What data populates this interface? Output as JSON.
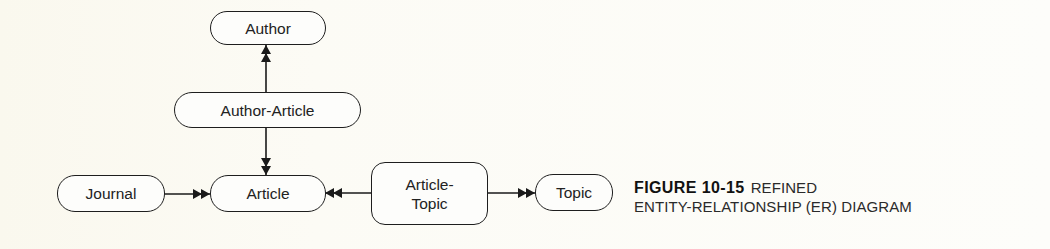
{
  "diagram": {
    "type": "entity-relationship",
    "entities": [
      {
        "id": "author",
        "label": "Author"
      },
      {
        "id": "author_article",
        "label": "Author-Article"
      },
      {
        "id": "journal",
        "label": "Journal"
      },
      {
        "id": "article",
        "label": "Article"
      },
      {
        "id": "article_topic",
        "label_line1": "Article-",
        "label_line2": "Topic"
      },
      {
        "id": "topic",
        "label": "Topic"
      }
    ],
    "relationships": [
      {
        "from": "author_article",
        "to": "author",
        "arrow": "double-head"
      },
      {
        "from": "author_article",
        "to": "article",
        "arrow": "double-head"
      },
      {
        "from": "journal",
        "to": "article",
        "arrow": "double-head"
      },
      {
        "from": "article_topic",
        "to": "article",
        "arrow": "double-head"
      },
      {
        "from": "article_topic",
        "to": "topic",
        "arrow": "double-head"
      }
    ]
  },
  "caption": {
    "figure_number": "FIGURE 10-15",
    "title_line1": "REFINED",
    "title_line2": "ENTITY-RELATIONSHIP (ER) DIAGRAM"
  },
  "colors": {
    "background": "#fcfbf6",
    "stroke": "#1e1e1e",
    "text": "#222222"
  }
}
